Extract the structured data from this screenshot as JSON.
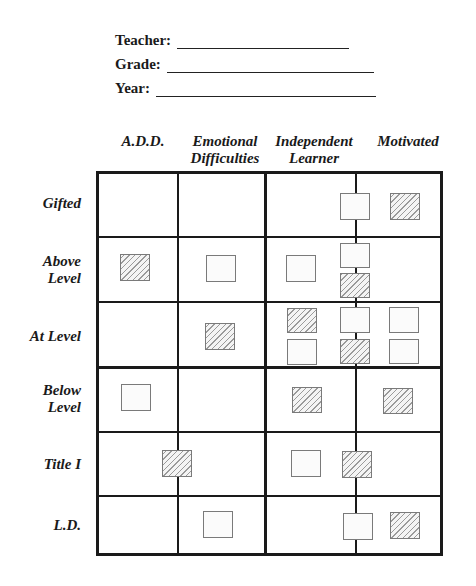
{
  "form": {
    "fields": [
      {
        "label": "Teacher:",
        "value": ""
      },
      {
        "label": "Grade:",
        "value": ""
      },
      {
        "label": "Year:",
        "value": ""
      }
    ]
  },
  "grid": {
    "columns": [
      {
        "line1": "A.D.D.",
        "line2": ""
      },
      {
        "line1": "Emotional",
        "line2": "Difficulties"
      },
      {
        "line1": "Independent",
        "line2": "Learner"
      },
      {
        "line1": "Motivated",
        "line2": ""
      }
    ],
    "rows": [
      {
        "line1": "Gifted",
        "line2": ""
      },
      {
        "line1": "Above",
        "line2": "Level"
      },
      {
        "line1": "At Level",
        "line2": ""
      },
      {
        "line1": "Below",
        "line2": "Level"
      },
      {
        "line1": "Title I",
        "line2": ""
      },
      {
        "line1": "L.D.",
        "line2": ""
      }
    ],
    "legend": {
      "plain_box": "student (unshaded)",
      "hatched_box": "student (shaded)"
    },
    "placements": [
      {
        "row": "Gifted",
        "position": "Independent/Motivated border",
        "style": "plain"
      },
      {
        "row": "Gifted",
        "position": "Motivated",
        "style": "hatched"
      },
      {
        "row": "Above Level",
        "position": "A.D.D.",
        "style": "hatched"
      },
      {
        "row": "Above Level",
        "position": "Emotional Difficulties",
        "style": "plain"
      },
      {
        "row": "Above Level",
        "position": "Independent Learner",
        "style": "plain"
      },
      {
        "row": "Above Level",
        "position": "Independent/Motivated border (top)",
        "style": "plain"
      },
      {
        "row": "Above Level",
        "position": "Independent/Motivated border (bottom)",
        "style": "hatched"
      },
      {
        "row": "At Level",
        "position": "Emotional Difficulties",
        "style": "hatched"
      },
      {
        "row": "At Level",
        "position": "Independent Learner (top)",
        "style": "hatched"
      },
      {
        "row": "At Level",
        "position": "Independent Learner (bottom)",
        "style": "plain"
      },
      {
        "row": "At Level",
        "position": "Independent/Motivated border (top)",
        "style": "plain"
      },
      {
        "row": "At Level",
        "position": "Independent/Motivated border (bottom)",
        "style": "hatched"
      },
      {
        "row": "At Level",
        "position": "Motivated (top)",
        "style": "plain"
      },
      {
        "row": "At Level",
        "position": "Motivated (bottom)",
        "style": "plain"
      },
      {
        "row": "Below Level",
        "position": "A.D.D.",
        "style": "plain"
      },
      {
        "row": "Below Level",
        "position": "Independent Learner",
        "style": "hatched"
      },
      {
        "row": "Below Level",
        "position": "Motivated",
        "style": "hatched"
      },
      {
        "row": "Title I",
        "position": "A.D.D./Emotional border",
        "style": "hatched"
      },
      {
        "row": "Title I",
        "position": "Independent Learner",
        "style": "plain"
      },
      {
        "row": "Title I",
        "position": "Independent/Motivated border",
        "style": "hatched"
      },
      {
        "row": "L.D.",
        "position": "Emotional Difficulties",
        "style": "plain"
      },
      {
        "row": "L.D.",
        "position": "Independent/Motivated border",
        "style": "plain"
      },
      {
        "row": "L.D.",
        "position": "Motivated",
        "style": "hatched"
      }
    ]
  },
  "colors": {
    "line": "#1a1a1a",
    "box_border": "#7a7a7a",
    "hatch": "#9a9a9a"
  }
}
